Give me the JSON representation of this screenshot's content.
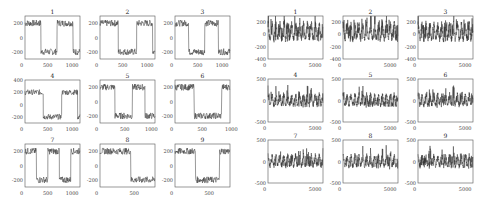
{
  "chart_data": [
    {
      "type": "line",
      "group": "left",
      "description": "3x3 grid of square-wave signals with noise",
      "panels": [
        {
          "title": "1",
          "xlim": [
            0,
            1200
          ],
          "ylim": [
            -300,
            300
          ],
          "xticks": [
            "0",
            "500",
            "1000"
          ],
          "yticks": [
            "200",
            "0",
            "-200"
          ],
          "segments": [
            [
              0,
              350,
              200
            ],
            [
              350,
              700,
              -200
            ],
            [
              700,
              1050,
              200
            ],
            [
              1050,
              1200,
              -200
            ]
          ]
        },
        {
          "title": "2",
          "xlim": [
            0,
            1200
          ],
          "ylim": [
            -300,
            300
          ],
          "xticks": [
            "0",
            "500",
            "1000"
          ],
          "yticks": [
            "200",
            "0",
            "-200"
          ],
          "segments": [
            [
              0,
              400,
              200
            ],
            [
              400,
              800,
              -200
            ],
            [
              800,
              1150,
              200
            ],
            [
              1150,
              1200,
              -200
            ]
          ]
        },
        {
          "title": "3",
          "xlim": [
            0,
            1200
          ],
          "ylim": [
            -300,
            300
          ],
          "xticks": [
            "0",
            "500",
            "1000"
          ],
          "yticks": [
            "200",
            "0",
            "-200"
          ],
          "segments": [
            [
              0,
              300,
              200
            ],
            [
              300,
              650,
              -200
            ],
            [
              650,
              950,
              200
            ],
            [
              950,
              1200,
              -200
            ]
          ]
        },
        {
          "title": "4",
          "xlim": [
            0,
            1200
          ],
          "ylim": [
            -300,
            400
          ],
          "xticks": [
            "0",
            "500",
            "1000"
          ],
          "yticks": [
            "400",
            "200",
            "0",
            "-200"
          ],
          "segments": [
            [
              0,
              400,
              200
            ],
            [
              400,
              800,
              -200
            ],
            [
              800,
              1150,
              200
            ],
            [
              1150,
              1200,
              -200
            ]
          ]
        },
        {
          "title": "5",
          "xlim": [
            0,
            1100
          ],
          "ylim": [
            -300,
            300
          ],
          "xticks": [
            "0",
            "500",
            "1000"
          ],
          "yticks": [
            "200",
            "0",
            "-200"
          ],
          "segments": [
            [
              0,
              300,
              200
            ],
            [
              300,
              650,
              -200
            ],
            [
              650,
              900,
              200
            ],
            [
              900,
              1100,
              -200
            ]
          ]
        },
        {
          "title": "6",
          "xlim": [
            0,
            1000
          ],
          "ylim": [
            -300,
            300
          ],
          "xticks": [
            "0",
            "500",
            "1000"
          ],
          "yticks": [
            "200",
            "0",
            "-200"
          ],
          "segments": [
            [
              0,
              350,
              200
            ],
            [
              350,
              700,
              -200
            ],
            [
              700,
              850,
              -200
            ],
            [
              850,
              1000,
              200
            ]
          ]
        },
        {
          "title": "7",
          "xlim": [
            0,
            1200
          ],
          "ylim": [
            -300,
            300
          ],
          "xticks": [
            "0",
            "500",
            "1000"
          ],
          "yticks": [
            "200",
            "0",
            "-200"
          ],
          "segments": [
            [
              0,
              250,
              200
            ],
            [
              250,
              500,
              -200
            ],
            [
              500,
              750,
              200
            ],
            [
              750,
              1000,
              -200
            ],
            [
              1000,
              1200,
              200
            ]
          ]
        },
        {
          "title": "8",
          "xlim": [
            0,
            800
          ],
          "ylim": [
            -300,
            300
          ],
          "xticks": [
            "0",
            "500"
          ],
          "yticks": [
            "200",
            "0",
            "-200"
          ],
          "segments": [
            [
              0,
              450,
              200
            ],
            [
              450,
              800,
              -200
            ]
          ]
        },
        {
          "title": "9",
          "xlim": [
            0,
            800
          ],
          "ylim": [
            -300,
            300
          ],
          "xticks": [
            "0",
            "500"
          ],
          "yticks": [
            "200",
            "0",
            "-200"
          ],
          "segments": [
            [
              0,
              300,
              200
            ],
            [
              300,
              650,
              -200
            ],
            [
              650,
              800,
              200
            ]
          ]
        }
      ]
    },
    {
      "type": "line",
      "group": "right",
      "description": "3x3 grid of dense oscillating signals with noise",
      "panels": [
        {
          "title": "1",
          "xlim": [
            0,
            6000
          ],
          "ylim": [
            -400,
            300
          ],
          "xticks": [
            "0",
            "5000"
          ],
          "yticks": [
            "200",
            "0",
            "-200",
            "-400"
          ]
        },
        {
          "title": "2",
          "xlim": [
            0,
            6000
          ],
          "ylim": [
            -400,
            300
          ],
          "xticks": [
            "0",
            "5000"
          ],
          "yticks": [
            "200",
            "0",
            "-200",
            "-400"
          ]
        },
        {
          "title": "3",
          "xlim": [
            0,
            6000
          ],
          "ylim": [
            -400,
            300
          ],
          "xticks": [
            "0",
            "5000"
          ],
          "yticks": [
            "200",
            "0",
            "-200",
            "-400"
          ]
        },
        {
          "title": "4",
          "xlim": [
            0,
            6000
          ],
          "ylim": [
            -500,
            500
          ],
          "xticks": [
            "0",
            "5000"
          ],
          "yticks": [
            "500",
            "0",
            "-500"
          ]
        },
        {
          "title": "5",
          "xlim": [
            0,
            6000
          ],
          "ylim": [
            -500,
            500
          ],
          "xticks": [
            "0",
            "5000"
          ],
          "yticks": [
            "500",
            "0",
            "-500"
          ]
        },
        {
          "title": "6",
          "xlim": [
            0,
            6000
          ],
          "ylim": [
            -500,
            500
          ],
          "xticks": [
            "0",
            "5000"
          ],
          "yticks": [
            "500",
            "0",
            "-500"
          ]
        },
        {
          "title": "7",
          "xlim": [
            0,
            6000
          ],
          "ylim": [
            -500,
            500
          ],
          "xticks": [
            "0",
            "5000"
          ],
          "yticks": [
            "500",
            "0",
            "-500"
          ]
        },
        {
          "title": "8",
          "xlim": [
            0,
            6000
          ],
          "ylim": [
            -500,
            500
          ],
          "xticks": [
            "0",
            "5000"
          ],
          "yticks": [
            "500",
            "0",
            "-500"
          ]
        },
        {
          "title": "9",
          "xlim": [
            0,
            6000
          ],
          "ylim": [
            -500,
            500
          ],
          "xticks": [
            "0",
            "5000"
          ],
          "yticks": [
            "500",
            "0",
            "-500"
          ]
        }
      ]
    }
  ],
  "style": {
    "line_color": "#333333",
    "axis_color": "#555555"
  }
}
